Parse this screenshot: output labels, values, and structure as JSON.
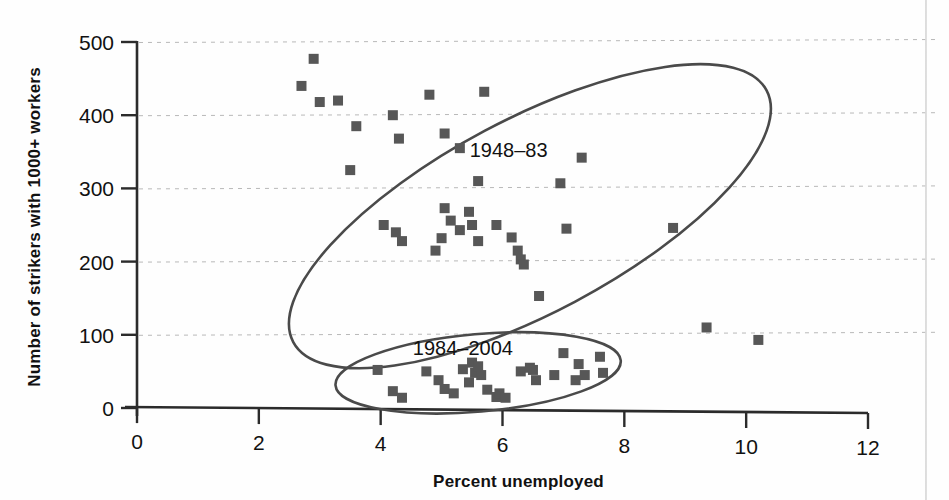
{
  "chart_data": {
    "type": "scatter",
    "title": "",
    "xlabel": "Percent unemployed",
    "ylabel": "Number of strikers with 1000+ workers",
    "xlim": [
      0,
      12
    ],
    "ylim": [
      0,
      500
    ],
    "xticks": [
      "0",
      "2",
      "4",
      "6",
      "8",
      "10",
      "12"
    ],
    "yticks": [
      "0",
      "100",
      "200",
      "300",
      "400",
      "500"
    ],
    "grid": "horizontal-dashed",
    "legend": "none",
    "marker": "filled-square",
    "marker_color": "#575757",
    "annotation_color": "#4a4a4a",
    "axis_color": "#2b2b2b",
    "grid_color": "#b9b9b9",
    "annotations": [
      {
        "text": "1948–83",
        "x": 6.1,
        "y": 352
      },
      {
        "text": "1984–2004",
        "x": 5.35,
        "y": 82
      }
    ],
    "groups": [
      {
        "name": "1948–83",
        "label": "1948–83",
        "ellipse": {
          "cx": 6.45,
          "cy": 262,
          "rx": 4.4,
          "ry": 132,
          "rotation": -28
        },
        "points": [
          [
            2.9,
            477
          ],
          [
            2.7,
            440
          ],
          [
            3.3,
            420
          ],
          [
            3.0,
            418
          ],
          [
            3.6,
            385
          ],
          [
            4.2,
            400
          ],
          [
            4.8,
            428
          ],
          [
            5.7,
            432
          ],
          [
            4.3,
            368
          ],
          [
            5.05,
            375
          ],
          [
            5.3,
            355
          ],
          [
            7.3,
            342
          ],
          [
            3.5,
            325
          ],
          [
            5.6,
            310
          ],
          [
            6.95,
            307
          ],
          [
            4.05,
            250
          ],
          [
            5.05,
            273
          ],
          [
            5.45,
            268
          ],
          [
            5.15,
            256
          ],
          [
            5.5,
            250
          ],
          [
            5.3,
            243
          ],
          [
            5.9,
            250
          ],
          [
            6.15,
            233
          ],
          [
            4.25,
            240
          ],
          [
            4.35,
            228
          ],
          [
            5.0,
            232
          ],
          [
            5.6,
            228
          ],
          [
            4.9,
            215
          ],
          [
            7.05,
            245
          ],
          [
            8.8,
            246
          ],
          [
            6.25,
            215
          ],
          [
            6.3,
            203
          ],
          [
            6.35,
            196
          ],
          [
            6.6,
            153
          ],
          [
            9.35,
            110
          ],
          [
            10.2,
            93
          ]
        ]
      },
      {
        "name": "1984–2004",
        "label": "1984–2004",
        "ellipse": {
          "cx": 5.6,
          "cy": 48,
          "rx": 2.35,
          "ry": 53,
          "rotation": -5
        },
        "points": [
          [
            3.95,
            52
          ],
          [
            4.2,
            23
          ],
          [
            4.35,
            14
          ],
          [
            4.75,
            50
          ],
          [
            4.95,
            38
          ],
          [
            5.05,
            26
          ],
          [
            5.2,
            20
          ],
          [
            5.35,
            53
          ],
          [
            5.45,
            35
          ],
          [
            5.5,
            62
          ],
          [
            5.55,
            48
          ],
          [
            5.6,
            57
          ],
          [
            5.65,
            45
          ],
          [
            5.75,
            25
          ],
          [
            5.9,
            15
          ],
          [
            5.95,
            20
          ],
          [
            6.05,
            14
          ],
          [
            6.3,
            50
          ],
          [
            6.45,
            55
          ],
          [
            6.5,
            52
          ],
          [
            6.55,
            38
          ],
          [
            6.85,
            45
          ],
          [
            7.0,
            75
          ],
          [
            7.2,
            38
          ],
          [
            7.25,
            60
          ],
          [
            7.35,
            45
          ],
          [
            7.6,
            70
          ],
          [
            7.65,
            48
          ]
        ]
      }
    ]
  }
}
